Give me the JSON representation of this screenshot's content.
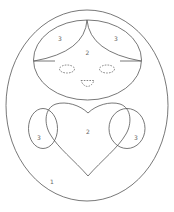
{
  "diagram": {
    "type": "matryoshka-doll-region-coloring",
    "stroke_color": "#555555",
    "background": "#ffffff",
    "regions": {
      "hair_left": "3",
      "hair_right": "3",
      "face": "2",
      "heart": "2",
      "cheek_left": "3",
      "cheek_right": "3",
      "body": "1"
    }
  }
}
